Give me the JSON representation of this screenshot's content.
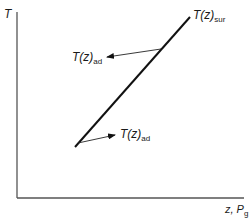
{
  "diagram": {
    "axes": {
      "y_label": "T",
      "x_label_main": "z, P",
      "x_label_sub": "g"
    },
    "curves": [
      {
        "name": "T(z)",
        "subscript": "sur",
        "description": "surrounding temperature profile line"
      }
    ],
    "annotations": [
      {
        "text": "T(z)",
        "subscript": "ad",
        "position": "upper-left",
        "arrow_direction": "left"
      },
      {
        "text": "T(z)",
        "subscript": "ad",
        "position": "lower-right",
        "arrow_direction": "right"
      }
    ],
    "colors": {
      "line": "#111111",
      "axis": "#555555",
      "text": "#1a1a1a"
    }
  }
}
